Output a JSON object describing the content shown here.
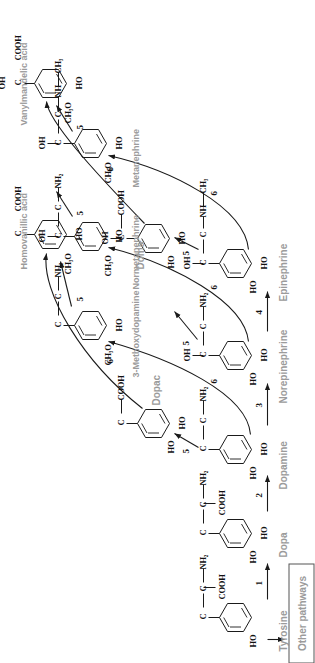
{
  "figure": {
    "orientation": "rotated-90-ccw",
    "label_color": "#9b9b9b",
    "stroke_color": "#1a1a1a"
  },
  "compounds": {
    "tyrosine": {
      "label": "Tyrosine",
      "substituents": [
        "HO"
      ],
      "side_chain": [
        "C",
        "C",
        "NH2"
      ],
      "extra": "COOH"
    },
    "dopa": {
      "label": "Dopa",
      "substituents": [
        "HO",
        "HO"
      ],
      "side_chain": [
        "C",
        "C",
        "NH2"
      ],
      "extra": "COOH"
    },
    "dopamine": {
      "label": "Dopamine",
      "substituents": [
        "HO",
        "HO"
      ],
      "side_chain": [
        "C",
        "C",
        "NH2"
      ],
      "extra": ""
    },
    "norepinephrine": {
      "label": "Norepinephrine",
      "substituents": [
        "HO",
        "HO"
      ],
      "side_chain": [
        "C",
        "C",
        "NH2"
      ],
      "extra": "OH"
    },
    "epinephrine": {
      "label": "Epinephrine",
      "substituents": [
        "HO",
        "HO"
      ],
      "side_chain": [
        "C",
        "C",
        "NH",
        "CH3"
      ],
      "extra": "OH"
    },
    "dopac": {
      "label": "Dopac",
      "substituents": [
        "HO",
        "HO"
      ],
      "side_chain": [
        "C",
        "COOH"
      ],
      "extra": ""
    },
    "doma": {
      "label": "Doma",
      "substituents": [
        "HO",
        "HO"
      ],
      "side_chain": [
        "C",
        "COOH"
      ],
      "extra": "OH"
    },
    "methoxydopamine": {
      "label": "3-Methoxydopamine",
      "substituents": [
        "CH3O",
        "HO"
      ],
      "side_chain": [
        "C",
        "C",
        "NH2"
      ],
      "extra": ""
    },
    "normetanephrine": {
      "label": "Normetanephrine",
      "substituents": [
        "CH3O",
        "HO"
      ],
      "side_chain": [
        "C",
        "C",
        "NH2"
      ],
      "extra": "OH"
    },
    "metanephrine": {
      "label": "Metanephrine",
      "substituents": [
        "CH3O",
        "HO"
      ],
      "side_chain": [
        "C",
        "C",
        "NH",
        "CH3"
      ],
      "extra": "OH"
    },
    "homovanillic_acid": {
      "label": "Homovanillic acid",
      "substituents": [
        "CH3O",
        "HO"
      ],
      "side_chain": [
        "C",
        "COOH"
      ],
      "extra": ""
    },
    "vanylmandelic_acid": {
      "label": "Vanylmandelic acid",
      "substituents": [
        "CH3O",
        "HO"
      ],
      "side_chain": [
        "C",
        "COOH"
      ],
      "extra": "OH"
    }
  },
  "other_pathways": {
    "label": "Other pathways"
  },
  "enzyme_numbers": {
    "tyrosine_to_dopa": "1",
    "dopa_to_dopamine": "2",
    "dopamine_to_norepinephrine": "3",
    "norepinephrine_to_epinephrine": "4",
    "dopamine_to_dopac": "5",
    "norepinephrine_to_doma": "5",
    "epinephrine_to_doma": "5",
    "methoxydopamine_to_homovanillic": "5",
    "metanephrine_to_vanylmandelic": "5",
    "normetanephrine_to_vanylmandelic": "5",
    "dopamine_to_methoxydopamine": "6",
    "dopac_to_homovanillic": "6",
    "norepinephrine_to_normetanephrine": "6",
    "epinephrine_to_metanephrine": "6",
    "doma_to_vanylmandelic": "6"
  },
  "atoms": {
    "HO": "HO",
    "CH3O": "CH₃O",
    "NH2": "NH₂",
    "NH": "NH",
    "CH3": "CH₃",
    "OH": "OH",
    "COOH": "COOH",
    "C": "C",
    "dash": "—"
  }
}
